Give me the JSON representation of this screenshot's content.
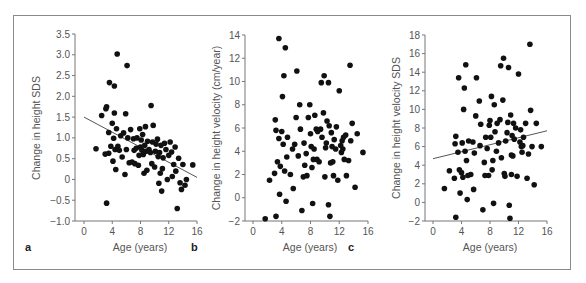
{
  "chart_data": [
    {
      "panel": "a",
      "type": "scatter",
      "xlabel": "Age (years)",
      "ylabel": "Change in height SDS",
      "xlim": [
        0,
        16
      ],
      "ylim": [
        -1.0,
        3.5
      ],
      "xticks": [
        0,
        4,
        8,
        12,
        16
      ],
      "yticks": [
        -1.0,
        -0.5,
        0,
        0.5,
        1.0,
        1.5,
        2.0,
        2.5,
        3.0,
        3.5
      ],
      "ytick_labels": [
        "−1.0",
        "−0.5",
        "0",
        "0.5",
        "1.0",
        "1.5",
        "2.0",
        "2.5",
        "3.0",
        "3.5"
      ],
      "grid": false,
      "regression_line": {
        "x": [
          0,
          16
        ],
        "y": [
          1.5,
          0.05
        ]
      },
      "points": [
        [
          1.7,
          0.74
        ],
        [
          2.5,
          1.54
        ],
        [
          3.0,
          0.61
        ],
        [
          3.1,
          1.7
        ],
        [
          3.2,
          1.75
        ],
        [
          3.2,
          -0.57
        ],
        [
          3.5,
          1.13
        ],
        [
          3.5,
          0.63
        ],
        [
          3.6,
          2.33
        ],
        [
          3.8,
          0.8
        ],
        [
          4.0,
          1.35
        ],
        [
          4.1,
          0.44
        ],
        [
          4.2,
          0.99
        ],
        [
          4.3,
          1.6
        ],
        [
          4.3,
          2.25
        ],
        [
          4.4,
          0.72
        ],
        [
          4.5,
          0.24
        ],
        [
          4.6,
          1.22
        ],
        [
          4.7,
          3.02
        ],
        [
          4.8,
          0.8
        ],
        [
          5.0,
          0.7
        ],
        [
          5.2,
          1.05
        ],
        [
          5.4,
          0.54
        ],
        [
          5.6,
          1.12
        ],
        [
          5.8,
          0.12
        ],
        [
          5.9,
          1.58
        ],
        [
          6.0,
          0.72
        ],
        [
          6.1,
          2.74
        ],
        [
          6.2,
          1.0
        ],
        [
          6.4,
          0.4
        ],
        [
          6.6,
          1.2
        ],
        [
          6.8,
          0.42
        ],
        [
          7.0,
          0.98
        ],
        [
          7.1,
          0.7
        ],
        [
          7.2,
          0.38
        ],
        [
          7.4,
          0.75
        ],
        [
          7.5,
          1.0
        ],
        [
          7.7,
          0.34
        ],
        [
          7.8,
          0.58
        ],
        [
          7.9,
          1.22
        ],
        [
          8.0,
          0.78
        ],
        [
          8.1,
          0.95
        ],
        [
          8.2,
          0.7
        ],
        [
          8.3,
          1.08
        ],
        [
          8.4,
          0.6
        ],
        [
          8.5,
          0.15
        ],
        [
          8.6,
          0.82
        ],
        [
          8.7,
          1.27
        ],
        [
          8.8,
          0.68
        ],
        [
          8.9,
          0.22
        ],
        [
          9.0,
          0.92
        ],
        [
          9.2,
          0.72
        ],
        [
          9.4,
          0.65
        ],
        [
          9.5,
          1.78
        ],
        [
          9.6,
          0.38
        ],
        [
          9.7,
          0.9
        ],
        [
          9.8,
          1.3
        ],
        [
          10.0,
          0.3
        ],
        [
          10.1,
          0.68
        ],
        [
          10.2,
          0.85
        ],
        [
          10.4,
          0.97
        ],
        [
          10.5,
          0.55
        ],
        [
          10.6,
          -0.09
        ],
        [
          10.7,
          0.65
        ],
        [
          10.8,
          0.15
        ],
        [
          10.9,
          0.82
        ],
        [
          11.0,
          -0.28
        ],
        [
          11.1,
          0.26
        ],
        [
          11.2,
          0.52
        ],
        [
          11.4,
          0.87
        ],
        [
          11.6,
          0.72
        ],
        [
          11.8,
          0.0
        ],
        [
          12.0,
          0.58
        ],
        [
          12.2,
          0.9
        ],
        [
          12.4,
          0.66
        ],
        [
          12.5,
          0.07
        ],
        [
          12.7,
          0.36
        ],
        [
          12.9,
          0.78
        ],
        [
          13.0,
          0.2
        ],
        [
          13.2,
          -0.7
        ],
        [
          13.4,
          0.51
        ],
        [
          13.6,
          -0.08
        ],
        [
          13.8,
          -0.24
        ],
        [
          14.0,
          0.36
        ],
        [
          14.3,
          -0.14
        ],
        [
          14.5,
          0.0
        ],
        [
          15.4,
          0.35
        ]
      ]
    },
    {
      "panel": "b",
      "type": "scatter",
      "xlabel": "Age (years)",
      "ylabel": "Change in height velocity (cm/year)",
      "xlim": [
        0,
        16
      ],
      "ylim": [
        -2,
        14
      ],
      "xticks": [
        0,
        4,
        8,
        12,
        16
      ],
      "yticks": [
        -2,
        0,
        2,
        4,
        6,
        8,
        10,
        12,
        14
      ],
      "ytick_labels": [
        "−2",
        "0",
        "2",
        "4",
        "6",
        "8",
        "10",
        "12",
        "14"
      ],
      "grid": false,
      "regression_line": null,
      "points": [
        [
          1.7,
          -1.8
        ],
        [
          2.3,
          1.5
        ],
        [
          3.0,
          2.1
        ],
        [
          3.1,
          6.7
        ],
        [
          3.2,
          5.8
        ],
        [
          3.2,
          -1.6
        ],
        [
          3.4,
          3.1
        ],
        [
          3.6,
          5.1
        ],
        [
          3.6,
          13.7
        ],
        [
          3.8,
          2.7
        ],
        [
          3.7,
          0.3
        ],
        [
          4.0,
          5.7
        ],
        [
          4.1,
          8.7
        ],
        [
          4.2,
          4.6
        ],
        [
          4.3,
          10.5
        ],
        [
          4.4,
          2.3
        ],
        [
          4.5,
          12.9
        ],
        [
          4.6,
          -0.3
        ],
        [
          4.7,
          3.5
        ],
        [
          4.8,
          5.2
        ],
        [
          5.2,
          2.0
        ],
        [
          5.5,
          4.2
        ],
        [
          5.6,
          0.8
        ],
        [
          5.8,
          4.6
        ],
        [
          6.0,
          6.9
        ],
        [
          6.1,
          10.9
        ],
        [
          6.3,
          3.6
        ],
        [
          6.5,
          8.0
        ],
        [
          6.6,
          5.9
        ],
        [
          6.8,
          -1.1
        ],
        [
          7.0,
          1.8
        ],
        [
          7.1,
          4.7
        ],
        [
          7.2,
          2.8
        ],
        [
          7.4,
          3.8
        ],
        [
          7.5,
          1.9
        ],
        [
          7.7,
          6.9
        ],
        [
          7.9,
          8.0
        ],
        [
          8.0,
          5.5
        ],
        [
          8.1,
          4.4
        ],
        [
          8.2,
          2.6
        ],
        [
          8.3,
          -0.5
        ],
        [
          8.4,
          3.3
        ],
        [
          8.5,
          4.2
        ],
        [
          8.6,
          7.1
        ],
        [
          8.8,
          5.9
        ],
        [
          8.9,
          3.3
        ],
        [
          9.0,
          5.7
        ],
        [
          9.2,
          3.1
        ],
        [
          9.4,
          5.9
        ],
        [
          9.5,
          9.9
        ],
        [
          9.6,
          5.2
        ],
        [
          9.8,
          7.3
        ],
        [
          9.9,
          10.5
        ],
        [
          10.0,
          1.8
        ],
        [
          10.1,
          4.3
        ],
        [
          10.2,
          4.7
        ],
        [
          10.3,
          6.6
        ],
        [
          10.5,
          9.9
        ],
        [
          10.5,
          -0.6
        ],
        [
          10.6,
          6.2
        ],
        [
          10.7,
          -1.6
        ],
        [
          10.8,
          3.0
        ],
        [
          10.9,
          5.6
        ],
        [
          11.0,
          4.4
        ],
        [
          11.1,
          3.1
        ],
        [
          11.2,
          1.9
        ],
        [
          11.3,
          5.0
        ],
        [
          11.5,
          4.2
        ],
        [
          11.6,
          6.1
        ],
        [
          11.8,
          1.5
        ],
        [
          12.0,
          9.2
        ],
        [
          12.2,
          4.5
        ],
        [
          12.3,
          3.9
        ],
        [
          12.4,
          4.9
        ],
        [
          12.5,
          4.2
        ],
        [
          12.6,
          5.2
        ],
        [
          12.7,
          3.3
        ],
        [
          12.9,
          5.4
        ],
        [
          13.0,
          1.9
        ],
        [
          13.3,
          3.2
        ],
        [
          13.5,
          11.4
        ],
        [
          13.6,
          4.9
        ],
        [
          13.8,
          6.4
        ],
        [
          14.2,
          0.9
        ],
        [
          14.5,
          5.5
        ],
        [
          15.3,
          3.9
        ]
      ]
    },
    {
      "panel": "c",
      "type": "scatter",
      "xlabel": "Age (years)",
      "ylabel": "Change in height velocity SDS",
      "xlim": [
        0,
        16
      ],
      "ylim": [
        -2,
        18
      ],
      "xticks": [
        0,
        4,
        8,
        12,
        16
      ],
      "yticks": [
        -2,
        0,
        2,
        4,
        6,
        8,
        10,
        12,
        14,
        16,
        18
      ],
      "ytick_labels": [
        "−2",
        "0",
        "2",
        "4",
        "6",
        "8",
        "10",
        "12",
        "14",
        "16",
        "18"
      ],
      "grid": false,
      "regression_line": {
        "x": [
          0,
          16
        ],
        "y": [
          4.7,
          7.7
        ]
      },
      "points": [
        [
          1.6,
          1.5
        ],
        [
          2.3,
          3.4
        ],
        [
          3.0,
          2.6
        ],
        [
          3.1,
          6.3
        ],
        [
          3.2,
          7.1
        ],
        [
          3.2,
          -1.6
        ],
        [
          3.5,
          5.4
        ],
        [
          3.6,
          13.4
        ],
        [
          3.7,
          3.5
        ],
        [
          3.8,
          1.0
        ],
        [
          4.0,
          3.2
        ],
        [
          4.1,
          6.4
        ],
        [
          4.2,
          2.7
        ],
        [
          4.3,
          10.0
        ],
        [
          4.4,
          12.3
        ],
        [
          4.5,
          5.5
        ],
        [
          4.6,
          14.8
        ],
        [
          4.7,
          4.5
        ],
        [
          4.8,
          0.3
        ],
        [
          4.9,
          2.9
        ],
        [
          5.0,
          6.6
        ],
        [
          5.3,
          3.0
        ],
        [
          5.6,
          6.5
        ],
        [
          5.7,
          1.4
        ],
        [
          5.8,
          5.3
        ],
        [
          6.0,
          9.3
        ],
        [
          6.1,
          13.4
        ],
        [
          6.5,
          10.9
        ],
        [
          6.6,
          6.1
        ],
        [
          6.7,
          8.4
        ],
        [
          7.0,
          -0.8
        ],
        [
          7.2,
          4.3
        ],
        [
          7.3,
          2.9
        ],
        [
          7.4,
          7.0
        ],
        [
          7.6,
          5.8
        ],
        [
          7.8,
          2.9
        ],
        [
          7.9,
          8.3
        ],
        [
          8.0,
          8.8
        ],
        [
          8.1,
          7.0
        ],
        [
          8.2,
          11.4
        ],
        [
          8.3,
          3.5
        ],
        [
          8.4,
          4.5
        ],
        [
          8.5,
          -0.1
        ],
        [
          8.6,
          10.5
        ],
        [
          8.7,
          7.6
        ],
        [
          8.9,
          5.5
        ],
        [
          9.0,
          8.5
        ],
        [
          9.2,
          6.4
        ],
        [
          9.4,
          8.9
        ],
        [
          9.5,
          14.7
        ],
        [
          9.6,
          4.8
        ],
        [
          9.8,
          11.0
        ],
        [
          9.9,
          15.5
        ],
        [
          10.0,
          3.1
        ],
        [
          10.1,
          2.8
        ],
        [
          10.2,
          6.6
        ],
        [
          10.4,
          7.5
        ],
        [
          10.5,
          8.6
        ],
        [
          10.6,
          14.5
        ],
        [
          10.7,
          -0.3
        ],
        [
          10.8,
          -1.7
        ],
        [
          10.9,
          9.4
        ],
        [
          11.0,
          5.1
        ],
        [
          11.0,
          3.0
        ],
        [
          11.1,
          7.2
        ],
        [
          11.2,
          5.0
        ],
        [
          11.3,
          8.5
        ],
        [
          11.4,
          6.8
        ],
        [
          11.6,
          8.0
        ],
        [
          11.8,
          2.8
        ],
        [
          12.0,
          13.8
        ],
        [
          12.2,
          6.5
        ],
        [
          12.3,
          7.8
        ],
        [
          12.4,
          6.0
        ],
        [
          12.5,
          5.4
        ],
        [
          12.6,
          6.1
        ],
        [
          12.7,
          7.0
        ],
        [
          13.0,
          8.5
        ],
        [
          13.2,
          2.6
        ],
        [
          13.4,
          5.2
        ],
        [
          13.6,
          17.0
        ],
        [
          13.7,
          9.9
        ],
        [
          13.9,
          6.0
        ],
        [
          14.2,
          1.9
        ],
        [
          14.5,
          8.5
        ],
        [
          15.2,
          6.0
        ]
      ]
    }
  ],
  "panels": {
    "a": {
      "letter": "a",
      "xlabel": "Age (years)",
      "ylabel": "Change in height SDS"
    },
    "b": {
      "letter": "b",
      "xlabel": "Age (years)",
      "ylabel": "Change in height velocity (cm/year)"
    },
    "c": {
      "letter": "c",
      "xlabel": "Age (years)",
      "ylabel": "Change in height velocity SDS"
    }
  },
  "style": {
    "point_color": "#111111",
    "axis_color": "#777777",
    "line_color": "#555555",
    "frame_color": "#8a8a8a"
  }
}
